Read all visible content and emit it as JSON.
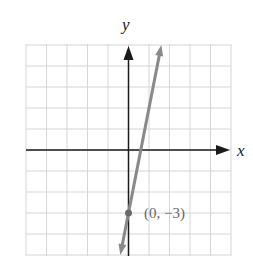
{
  "chart_data": {
    "type": "line",
    "title": "",
    "xlabel": "x",
    "ylabel": "y",
    "xlim": [
      -5,
      5
    ],
    "ylim": [
      -5,
      5
    ],
    "grid": true,
    "series": [
      {
        "name": "y = 5x - 3",
        "slope": 5,
        "intercept": -3,
        "x": [
          -0.4,
          0,
          0.6,
          1.6
        ],
        "y": [
          -5,
          -3,
          0,
          5
        ],
        "color": "#8a8a8a",
        "arrows": "both"
      }
    ],
    "annotations": [
      {
        "point": [
          0,
          -3
        ],
        "label": "(0, −3)",
        "marker": "filled-circle"
      }
    ]
  },
  "labels": {
    "x_axis": "x",
    "y_axis": "y",
    "point": "(0, −3)"
  },
  "colors": {
    "grid": "#d6d6d6",
    "axis": "#1a1a1a",
    "line": "#8a8a8a",
    "point": "#6a6a6a",
    "point_label": "#666666"
  }
}
